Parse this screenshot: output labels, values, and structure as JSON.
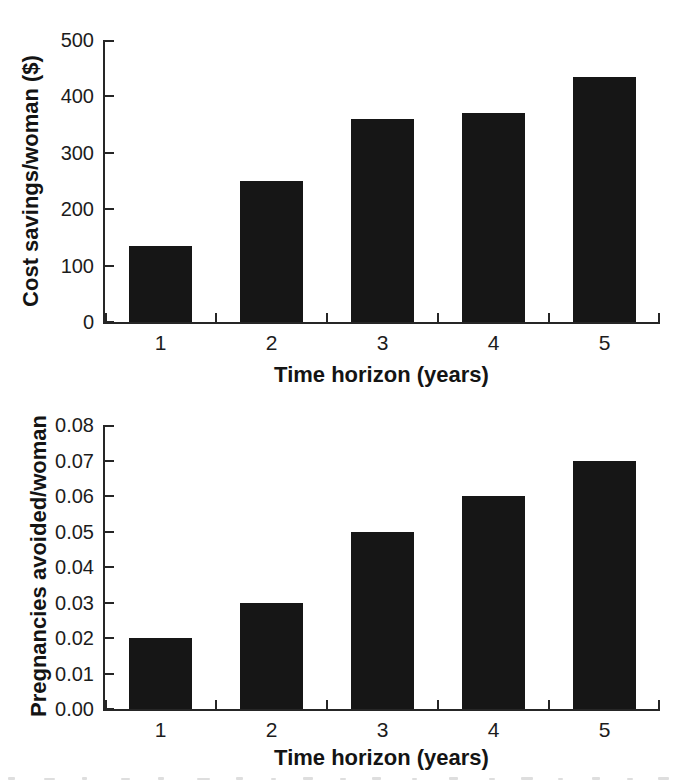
{
  "figure": {
    "background_color": "#ffffff",
    "ink_color": "#161616",
    "bottom_edge_note": "faint gray tops of a cut-off caption line along the bottom edge"
  },
  "chart_data": [
    {
      "type": "bar",
      "title": "",
      "xlabel": "Time horizon (years)",
      "ylabel": "Cost savings/woman ($)",
      "categories": [
        "1",
        "2",
        "3",
        "4",
        "5"
      ],
      "values": [
        135,
        250,
        360,
        370,
        435
      ],
      "ylim": [
        0,
        500
      ],
      "yticks": [
        "0",
        "100",
        "200",
        "300",
        "400",
        "500"
      ],
      "grid": false,
      "legend": "none",
      "bar_color": "#161616"
    },
    {
      "type": "bar",
      "title": "",
      "xlabel": "Time horizon (years)",
      "ylabel": "Pregnancies avoided/woman",
      "categories": [
        "1",
        "2",
        "3",
        "4",
        "5"
      ],
      "values": [
        0.02,
        0.03,
        0.05,
        0.06,
        0.07
      ],
      "ylim": [
        0,
        0.08
      ],
      "yticks": [
        "0.00",
        "0.01",
        "0.02",
        "0.03",
        "0.04",
        "0.05",
        "0.06",
        "0.07",
        "0.08"
      ],
      "grid": false,
      "legend": "none",
      "bar_color": "#161616"
    }
  ]
}
